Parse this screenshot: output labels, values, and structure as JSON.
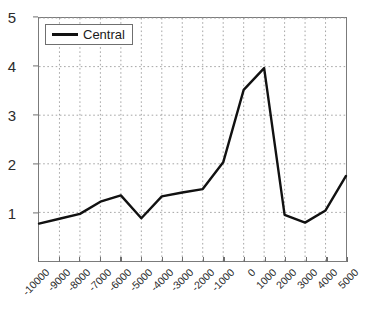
{
  "chart_data": {
    "type": "line",
    "title": "",
    "subtitle": "",
    "xlabel": "",
    "ylabel": "",
    "xlim": [
      -10000,
      5000
    ],
    "ylim": [
      0,
      5
    ],
    "grid": true,
    "grid_style": "dotted",
    "legend_position": "top-left",
    "x": [
      -10000,
      -9000,
      -8000,
      -7000,
      -6000,
      -5000,
      -4000,
      -3000,
      -2000,
      -1000,
      0,
      1000,
      2000,
      3000,
      4000,
      5000
    ],
    "xticklabels": [
      "-10000",
      "-9000",
      "-8000",
      "-7000",
      "-6000",
      "-5000",
      "-4000",
      "-3000",
      "-2000",
      "-1000",
      "0",
      "1000",
      "2000",
      "3000",
      "4000",
      "5000"
    ],
    "yticks": [
      1,
      2,
      3,
      4,
      5
    ],
    "yticklabels": [
      "1",
      "2",
      "3",
      "4",
      "5"
    ],
    "series": [
      {
        "name": "Central",
        "color": "#111111",
        "values": [
          0.77,
          0.87,
          0.97,
          1.22,
          1.35,
          0.88,
          1.33,
          1.41,
          1.48,
          2.03,
          3.52,
          3.97,
          0.95,
          0.79,
          1.04,
          1.75
        ]
      }
    ],
    "annotations": []
  },
  "legend": {
    "entries": [
      {
        "label": "Central",
        "color": "#111111"
      }
    ]
  },
  "axes": {
    "frame_color": "#7b7b7b",
    "grid_color": "#9a9a9a",
    "tick_color": "#6f6f6f",
    "label_color": "#2b2b2b"
  }
}
